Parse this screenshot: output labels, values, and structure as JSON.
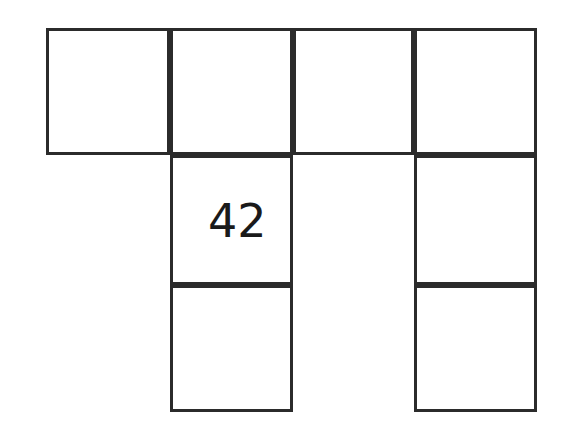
{
  "figure": {
    "kind": "grid-of-squares",
    "background_color": "#ffffff",
    "line_color": "#2b2b2b",
    "line_width_px": 3,
    "label_color": "#1a1a1a",
    "rows": 3,
    "columns": 4,
    "column_edges_px": [
      46,
      170,
      293,
      414,
      537
    ],
    "row_edges_px": [
      28,
      155,
      285,
      412
    ],
    "cells": [
      {
        "id": "cell-r1c1",
        "row": 1,
        "col": 1,
        "label": "",
        "x": 46,
        "y": 28,
        "w": 124,
        "h": 127,
        "label_x": 0,
        "label_y": 0,
        "label_size": 0
      },
      {
        "id": "cell-r1c2",
        "row": 1,
        "col": 2,
        "label": "",
        "x": 170,
        "y": 28,
        "w": 123,
        "h": 127,
        "label_x": 0,
        "label_y": 0,
        "label_size": 0
      },
      {
        "id": "cell-r1c3",
        "row": 1,
        "col": 3,
        "label": "",
        "x": 293,
        "y": 28,
        "w": 121,
        "h": 127,
        "label_x": 0,
        "label_y": 0,
        "label_size": 0
      },
      {
        "id": "cell-r1c4",
        "row": 1,
        "col": 4,
        "label": "",
        "x": 414,
        "y": 28,
        "w": 123,
        "h": 127,
        "label_x": 0,
        "label_y": 0,
        "label_size": 0
      },
      {
        "id": "cell-r2c2",
        "row": 2,
        "col": 2,
        "label": "42",
        "x": 170,
        "y": 155,
        "w": 123,
        "h": 130,
        "label_x": 35,
        "label_y": 40,
        "label_size": 46
      },
      {
        "id": "cell-r2c4",
        "row": 2,
        "col": 4,
        "label": "",
        "x": 414,
        "y": 155,
        "w": 123,
        "h": 130,
        "label_x": 0,
        "label_y": 0,
        "label_size": 0
      },
      {
        "id": "cell-r3c2",
        "row": 3,
        "col": 2,
        "label": "",
        "x": 170,
        "y": 285,
        "w": 123,
        "h": 127,
        "label_x": 0,
        "label_y": 0,
        "label_size": 0
      },
      {
        "id": "cell-r3c4",
        "row": 3,
        "col": 4,
        "label": "",
        "x": 414,
        "y": 285,
        "w": 123,
        "h": 127,
        "label_x": 0,
        "label_y": 0,
        "label_size": 0
      }
    ],
    "labels_present": [
      "42"
    ]
  }
}
